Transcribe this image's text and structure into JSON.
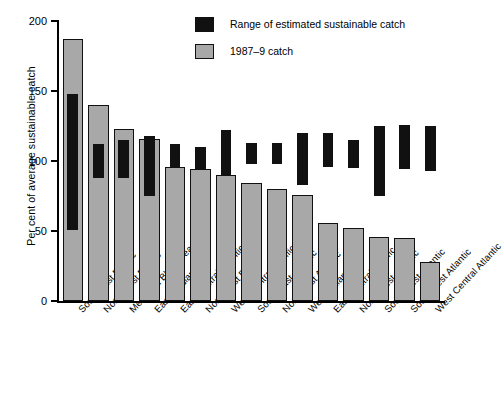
{
  "chart_data": {
    "type": "bar",
    "title": "",
    "xlabel": "",
    "ylabel": "Per cent of average sustainable catch",
    "ylim": [
      0,
      200
    ],
    "yticks": [
      0,
      50,
      100,
      150,
      200
    ],
    "grid": false,
    "legend_position": "top-right",
    "legend": [
      {
        "key": "range",
        "label": "Range of estimated sustainable catch",
        "color": "#111111"
      },
      {
        "key": "catch",
        "label": "1987–9 catch",
        "color": "#a8a8a8"
      }
    ],
    "categories": [
      "South-east Pacific",
      "North-west Pacific",
      "Med. and Black Sea",
      "East Inadian",
      "East Central Atlantic",
      "North-east Pacific",
      "West Central Pacific",
      "South-east Atlantic",
      "North-east Atlantic",
      "West Indian",
      "East Central Pacific",
      "North-west Atlantic",
      "South-west Atlantic",
      "South-west Atlantic",
      "West Central Atlantic"
    ],
    "series": [
      {
        "name": "1987–9 catch",
        "type": "bar",
        "color": "#a8a8a8",
        "values": [
          187,
          140,
          123,
          116,
          96,
          94,
          90,
          84,
          80,
          76,
          56,
          52,
          46,
          45,
          28
        ]
      },
      {
        "name": "Range of estimated sustainable catch",
        "type": "range",
        "color": "#111111",
        "low": [
          51,
          88,
          88,
          75,
          96,
          94,
          90,
          98,
          98,
          83,
          96,
          95,
          75,
          94,
          93
        ],
        "high": [
          148,
          112,
          115,
          118,
          112,
          110,
          122,
          113,
          113,
          120,
          120,
          115,
          125,
          126,
          125
        ]
      }
    ]
  }
}
